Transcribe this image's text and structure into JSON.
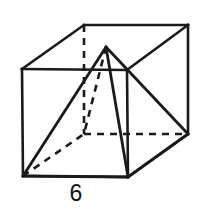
{
  "figure": {
    "caption": "6",
    "shape_name": "cube-with-inscribed-pyramid",
    "stroke_color": "#1a1a1a",
    "background_color": "#ffffff",
    "vertices": {
      "front_top_left": [
        22,
        69
      ],
      "front_top_right": [
        127,
        70
      ],
      "front_bottom_left": [
        23,
        176
      ],
      "front_bottom_right": [
        128,
        177
      ],
      "back_top_left": [
        84,
        25
      ],
      "back_top_right": [
        188,
        25
      ],
      "back_bottom_left": [
        84,
        134
      ],
      "back_bottom_right": [
        188,
        134
      ],
      "apex": [
        106,
        47
      ]
    },
    "solid_edges": [
      [
        22,
        69,
        127,
        70
      ],
      [
        127,
        70,
        128,
        177
      ],
      [
        128,
        177,
        23,
        176
      ],
      [
        23,
        176,
        22,
        69
      ],
      [
        22,
        69,
        84,
        25
      ],
      [
        84,
        25,
        188,
        25
      ],
      [
        188,
        25,
        127,
        70
      ],
      [
        188,
        25,
        188,
        134
      ],
      [
        188,
        134,
        128,
        177
      ]
    ],
    "hidden_edges": [
      [
        84,
        25,
        84,
        134
      ],
      [
        84,
        134,
        188,
        134
      ]
    ],
    "pyramid_solid_edges": [
      [
        106,
        47,
        23,
        176
      ],
      [
        106,
        47,
        128,
        177
      ],
      [
        106,
        47,
        188,
        134
      ],
      [
        23,
        176,
        128,
        177
      ],
      [
        128,
        177,
        188,
        134
      ]
    ],
    "pyramid_hidden_edges": [
      [
        106,
        47,
        84,
        134
      ],
      [
        23,
        176,
        84,
        134
      ]
    ]
  }
}
